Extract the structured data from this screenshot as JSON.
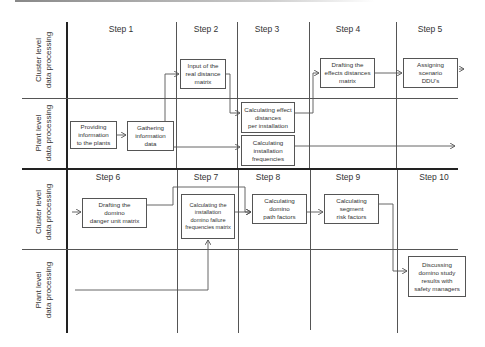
{
  "diagram": {
    "type": "swimlane-process-flow",
    "top_section": {
      "steps": [
        "Step 1",
        "Step 2",
        "Step 3",
        "Step 4",
        "Step 5"
      ],
      "lanes": {
        "cluster": [
          "Cluster level",
          "data processing"
        ],
        "plant": [
          "Plant level",
          "data processing"
        ]
      },
      "boxes": {
        "providing_info": [
          "Providing",
          "information",
          "to the plants"
        ],
        "gathering_info": [
          "Gathering",
          "information",
          "data"
        ],
        "input_real_distance": [
          "Input of the",
          "real distance",
          "matrix"
        ],
        "calc_effect_distances": [
          "Calculating effect",
          "distances",
          "per installation"
        ],
        "calc_install_freq": [
          "Calculating",
          "installation",
          "frequencies"
        ],
        "drafting_effects_matrix": [
          "Drafting the",
          "effects distances",
          "matrix"
        ],
        "assigning_ddu": [
          "Assigning",
          "scenario",
          "DDU's"
        ]
      }
    },
    "bottom_section": {
      "steps": [
        "Step 6",
        "Step 7",
        "Step 8",
        "Step 9",
        "Step 10"
      ],
      "lanes": {
        "cluster": [
          "Cluster level",
          "data processing"
        ],
        "plant": [
          "Plant level",
          "data processing"
        ]
      },
      "boxes": {
        "drafting_domino_matrix": [
          "Drafting the",
          "domino",
          "danger unit matrix"
        ],
        "calc_failure_freq_matrix": [
          "Calculating the",
          "installation",
          "domino failure",
          "frequencies matrix"
        ],
        "calc_path_factors": [
          "Calculating",
          "domino",
          "path factors"
        ],
        "calc_segment_risk": [
          "Calculating",
          "segment",
          "risk factors"
        ],
        "discussing_results": [
          "Discussing",
          "domino study",
          "results with",
          "safety managers"
        ]
      }
    },
    "colors": {
      "line": "#555555",
      "thick_line": "#222222",
      "text": "#333333",
      "background": "#ffffff"
    }
  }
}
